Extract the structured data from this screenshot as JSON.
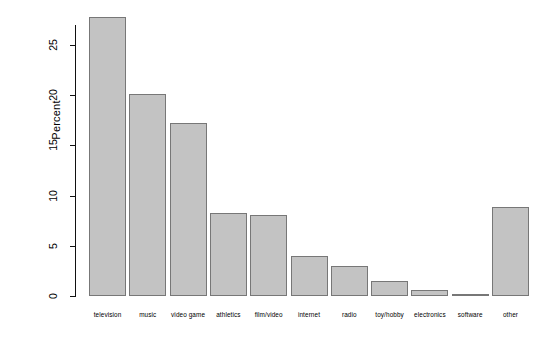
{
  "chart_data": {
    "type": "bar",
    "title": "",
    "xlabel": "",
    "ylabel": "Percent",
    "categories": [
      "television",
      "music",
      "video game",
      "athletics",
      "film/video",
      "internet",
      "radio",
      "toy/hobby",
      "electronics",
      "software",
      "other"
    ],
    "values": [
      27.8,
      20.1,
      17.2,
      8.3,
      8.1,
      4.0,
      3.0,
      1.5,
      0.6,
      0.2,
      8.9
    ],
    "ylim": [
      0,
      27.8
    ],
    "yticks": [
      0,
      5,
      10,
      15,
      20,
      25
    ],
    "ytick_labels": [
      "0",
      "5",
      "10",
      "15",
      "20",
      "25"
    ],
    "grid": false,
    "legend": false,
    "bar_fill_color": "#c3c3c3",
    "bar_border_color": "#777777",
    "background_color": "#ffffff",
    "axis_color": "#111111"
  }
}
